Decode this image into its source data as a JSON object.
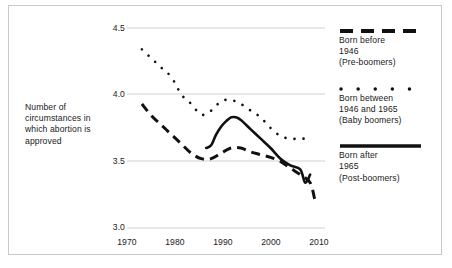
{
  "chart_data": {
    "type": "line",
    "title": "",
    "subtitle": "",
    "xlabel": "",
    "ylabel": "Number of circumstances in which abortion is approved",
    "xlim": [
      1970,
      2010
    ],
    "ylim": [
      3.0,
      4.5
    ],
    "xticks": [
      "1970",
      "1980",
      "1990",
      "2000",
      "2010"
    ],
    "yticks": [
      "4.5",
      "4.0",
      "3.5",
      "3.0"
    ],
    "grid": "horizontal",
    "legend_position": "right",
    "series": [
      {
        "name": "Born before 1946 (Pre-boomers)",
        "style": "dashed",
        "color": "#111111",
        "x": [
          1973,
          1975,
          1977,
          1979,
          1981,
          1983,
          1985,
          1987,
          1989,
          1991,
          1993,
          1995,
          1997,
          1999,
          2001,
          2003,
          2005,
          2007,
          2008
        ],
        "values": [
          3.93,
          3.84,
          3.77,
          3.7,
          3.63,
          3.56,
          3.52,
          3.52,
          3.56,
          3.6,
          3.6,
          3.57,
          3.55,
          3.53,
          3.5,
          3.45,
          3.4,
          3.34,
          3.2
        ]
      },
      {
        "name": "Born between 1946 and 1965 (Baby boomers)",
        "style": "dotted",
        "color": "#111111",
        "x": [
          1973,
          1975,
          1977,
          1979,
          1981,
          1983,
          1985,
          1987,
          1989,
          1991,
          1993,
          1995,
          1997,
          1999,
          2001,
          2003,
          2005,
          2007
        ],
        "values": [
          4.34,
          4.27,
          4.2,
          4.13,
          4.0,
          3.93,
          3.85,
          3.88,
          3.95,
          3.96,
          3.93,
          3.88,
          3.83,
          3.75,
          3.69,
          3.67,
          3.67,
          3.67
        ]
      },
      {
        "name": "Born after 1965 (Post-boomers)",
        "style": "solid",
        "color": "#111111",
        "x": [
          1986,
          1987,
          1988,
          1989,
          1990,
          1991,
          1992,
          1993,
          1995,
          1997,
          1999,
          2001,
          2003,
          2005,
          2006,
          2007
        ],
        "values": [
          3.6,
          3.62,
          3.7,
          3.76,
          3.8,
          3.83,
          3.83,
          3.81,
          3.74,
          3.67,
          3.6,
          3.52,
          3.47,
          3.44,
          3.34,
          3.4
        ]
      }
    ]
  },
  "axis": {
    "y_label_text": "Number of circumstances in which abortion is approved"
  },
  "legend": {
    "entries": [
      {
        "sample": "dashed-line-sample",
        "line1": "Born before",
        "line2": "1946",
        "line3": "(Pre-boomers)"
      },
      {
        "sample": "dotted-line-sample",
        "line1": "Born between",
        "line2": "1946 and 1965",
        "line3": "(Baby boomers)"
      },
      {
        "sample": "solid-line-sample",
        "line1": "Born after",
        "line2": "1965",
        "line3": "(Post-boomers)"
      }
    ]
  },
  "colors": {
    "ink": "#111111",
    "grid": "#d0d0d0",
    "frame": "#c9c9c9"
  }
}
